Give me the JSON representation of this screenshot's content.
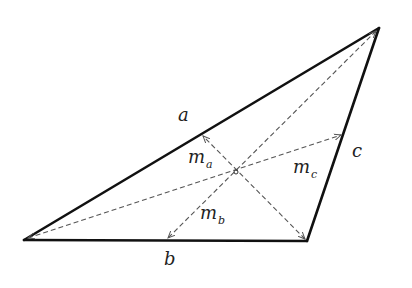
{
  "diagram": {
    "type": "triangle-medians",
    "colors": {
      "background": "#ffffff",
      "side_stroke": "#111111",
      "median_stroke": "#555555",
      "text": "#222222"
    },
    "vertices": {
      "A": {
        "x": 24,
        "y": 240
      },
      "B": {
        "x": 307,
        "y": 241
      },
      "C": {
        "x": 379,
        "y": 28
      }
    },
    "centroid": {
      "x": 236,
      "y": 172
    },
    "sides": [
      {
        "name": "a",
        "label": "a",
        "label_pos": {
          "x": 178,
          "y": 106
        }
      },
      {
        "name": "b",
        "label": "b",
        "label_pos": {
          "x": 164,
          "y": 252
        }
      },
      {
        "name": "c",
        "label": "c",
        "label_pos": {
          "x": 352,
          "y": 142
        }
      }
    ],
    "medians": [
      {
        "name": "m_a",
        "label": "m",
        "subscript": "a",
        "label_pos": {
          "x": 188,
          "y": 148
        }
      },
      {
        "name": "m_b",
        "label": "m",
        "subscript": "b",
        "label_pos": {
          "x": 200,
          "y": 204
        }
      },
      {
        "name": "m_c",
        "label": "m",
        "subscript": "c",
        "label_pos": {
          "x": 293,
          "y": 158
        }
      }
    ]
  }
}
